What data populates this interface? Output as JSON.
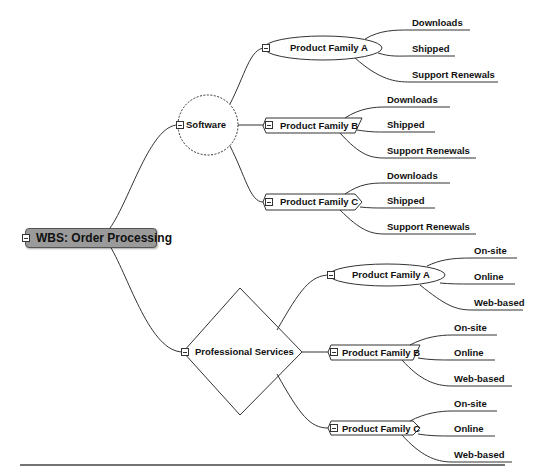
{
  "diagram": {
    "type": "mind-map",
    "root": {
      "label": "WBS: Order Processing"
    },
    "branches": [
      {
        "label": "Software",
        "shape": "dashed-circle",
        "children": [
          {
            "label": "Product Family A",
            "shape": "ellipse",
            "leaves": [
              "Downloads",
              "Shipped",
              "Support Renewals"
            ]
          },
          {
            "label": "Product Family B",
            "shape": "parallelogram",
            "leaves": [
              "Downloads",
              "Shipped",
              "Support Renewals"
            ]
          },
          {
            "label": "Product Family C",
            "shape": "chevron",
            "leaves": [
              "Downloads",
              "Shipped",
              "Support Renewals"
            ]
          }
        ]
      },
      {
        "label": "Professional Services",
        "shape": "diamond",
        "children": [
          {
            "label": "Product Family A",
            "shape": "ellipse",
            "leaves": [
              "On-site",
              "Online",
              "Web-based"
            ]
          },
          {
            "label": "Product Family B",
            "shape": "parallelogram",
            "leaves": [
              "On-site",
              "Online",
              "Web-based"
            ]
          },
          {
            "label": "Product Family C",
            "shape": "chevron",
            "leaves": [
              "On-site",
              "Online",
              "Web-based"
            ]
          }
        ]
      }
    ]
  },
  "colors": {
    "root_fill": "#9a9a9a",
    "line": "#333333",
    "text": "#111111"
  }
}
